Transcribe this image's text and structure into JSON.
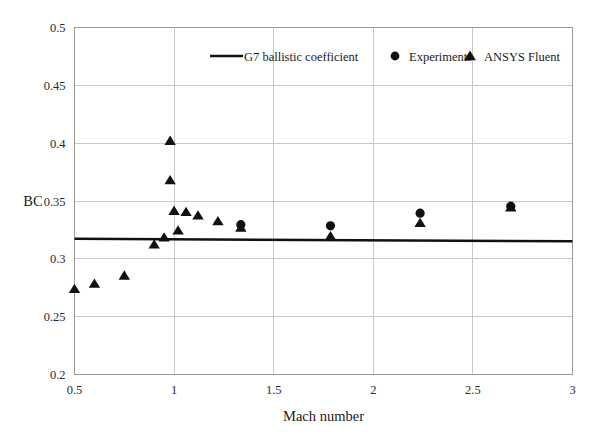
{
  "chart_data": {
    "type": "scatter",
    "title": "",
    "xlabel": "Mach number",
    "ylabel": "BC",
    "xlim": [
      0.5,
      3
    ],
    "ylim": [
      0.2,
      0.5
    ],
    "xticks": [
      "0.5",
      "1",
      "1.5",
      "2",
      "2.5",
      "3"
    ],
    "xtick_values": [
      0.5,
      1,
      1.5,
      2,
      2.5,
      3
    ],
    "yticks": [
      "0.2",
      "0.25",
      "0.3",
      "0.35",
      "0.4",
      "0.45",
      "0.5"
    ],
    "ytick_values": [
      0.2,
      0.25,
      0.3,
      0.35,
      0.4,
      0.45,
      0.5
    ],
    "grid": true,
    "legend_position": "top-inside",
    "series": [
      {
        "name": "G7 ballistic coefficient",
        "marker": "line",
        "color": "#111111",
        "x": [
          0.5,
          3.0
        ],
        "values": [
          0.3173,
          0.3152
        ]
      },
      {
        "name": "Experiments",
        "marker": "circle",
        "color": "#111111",
        "x": [
          1.335,
          1.785,
          2.235,
          2.69
        ],
        "values": [
          0.3295,
          0.3285,
          0.3395,
          0.3455
        ]
      },
      {
        "name": "ANSYS Fluent",
        "marker": "triangle",
        "color": "#111111",
        "x": [
          0.5,
          0.6,
          0.75,
          0.9,
          0.95,
          0.98,
          0.98,
          1.0,
          1.02,
          1.06,
          1.12,
          1.22,
          1.335,
          1.785,
          2.235,
          2.69
        ],
        "values": [
          0.274,
          0.2785,
          0.2855,
          0.3125,
          0.3185,
          0.402,
          0.368,
          0.3415,
          0.3245,
          0.3405,
          0.3375,
          0.3325,
          0.327,
          0.3195,
          0.331,
          0.3445
        ]
      }
    ]
  },
  "legend": {
    "items": [
      {
        "label": "G7 ballistic coefficient",
        "marker": "line"
      },
      {
        "label": "Experiments",
        "marker": "circle"
      },
      {
        "label": "ANSYS Fluent",
        "marker": "triangle"
      }
    ]
  },
  "axes": {
    "x_title": "Mach number",
    "y_title": "BC"
  }
}
